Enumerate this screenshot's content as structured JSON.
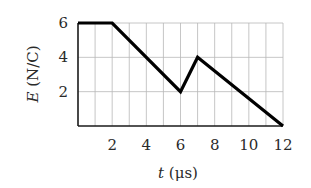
{
  "chart_data": {
    "type": "line",
    "title": "",
    "xlabel": "t (μs)",
    "xlabel_var": "t",
    "xlabel_unit": " (μs)",
    "ylabel": "E (N/C)",
    "ylabel_var": "E",
    "ylabel_unit": " (N/C)",
    "xlim": [
      0,
      12
    ],
    "ylim": [
      0,
      6
    ],
    "x_ticks": [
      2,
      4,
      6,
      8,
      10,
      12
    ],
    "y_ticks": [
      2,
      4,
      6
    ],
    "x_grid_step": 1,
    "y_grid_step": 2,
    "grid": true,
    "legend": null,
    "series": [
      {
        "name": "E(t)",
        "x": [
          0,
          2,
          6,
          7,
          12
        ],
        "y": [
          6,
          6,
          2,
          4,
          0
        ],
        "color": "#000000"
      }
    ]
  },
  "layout": {
    "plot_left": 78,
    "plot_right": 283,
    "plot_top": 23,
    "plot_bottom": 126
  }
}
